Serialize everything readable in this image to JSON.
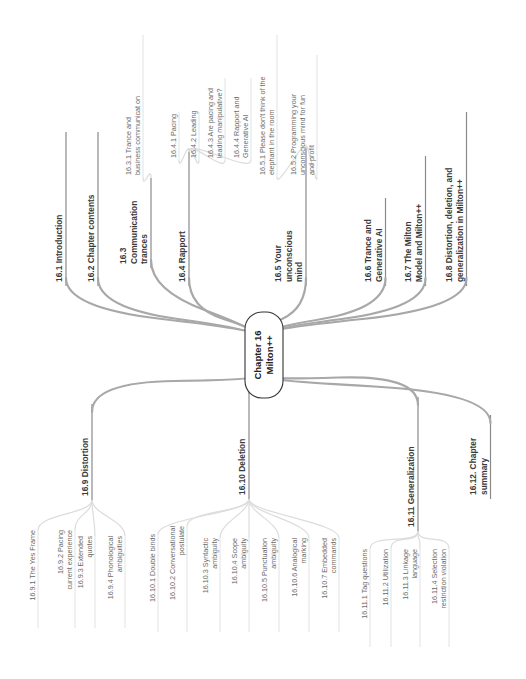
{
  "center": {
    "lines": [
      "Chapter 16",
      "Milton++"
    ]
  },
  "branches": [
    {
      "id": "16.1",
      "lines": [
        "16.1 Introduction"
      ],
      "children": []
    },
    {
      "id": "16.2",
      "lines": [
        "16.2 Chapter contents"
      ],
      "children": []
    },
    {
      "id": "16.3",
      "lines": [
        "16.3",
        "Communication",
        "trances"
      ],
      "children": [
        {
          "lines": [
            "16.3.1 Trance and",
            "business communicat on"
          ]
        }
      ]
    },
    {
      "id": "16.4",
      "lines": [
        "16.4 Rapport"
      ],
      "children": [
        {
          "lines": [
            "16.4.1 Pacing"
          ]
        },
        {
          "lines": [
            "16.4.2 Leading"
          ]
        },
        {
          "lines": [
            "16.4.3 Are pacing and",
            "leading manipulative?"
          ]
        },
        {
          "lines": [
            "16.4.4 Rapport and",
            "Generative AI"
          ]
        }
      ]
    },
    {
      "id": "16.5",
      "lines": [
        "16.5 Your",
        "unconscious",
        "mind"
      ],
      "children": [
        {
          "lines": [
            "16.5.1 Please don't think of the",
            "elephant in the room"
          ]
        },
        {
          "lines": [
            "16.5.2 Programming your",
            "unconscious mind for fun",
            "and profit"
          ]
        }
      ]
    },
    {
      "id": "16.6",
      "lines": [
        "16.6 Trance and",
        "Generative AI"
      ],
      "children": []
    },
    {
      "id": "16.7",
      "lines": [
        "16.7 The Milton",
        "Model and Milton++"
      ],
      "children": []
    },
    {
      "id": "16.8",
      "lines": [
        "16.8 Distortion, deletion, and",
        "generalization in Milton++"
      ],
      "children": []
    },
    {
      "id": "16.9",
      "lines": [
        "16.9 Distortion"
      ],
      "children": [
        {
          "lines": [
            "16.9.1 The Yes Frame"
          ]
        },
        {
          "lines": [
            "16.9.2 Pacing",
            "current experience"
          ]
        },
        {
          "lines": [
            "16.9.3 Extended",
            "quotes"
          ]
        },
        {
          "lines": [
            "16.9.4 Phonological",
            "ambiguities"
          ]
        }
      ]
    },
    {
      "id": "16.10",
      "lines": [
        "16.10 Deletion"
      ],
      "children": [
        {
          "lines": [
            "16.10.1 Double binds"
          ]
        },
        {
          "lines": [
            "16.10.2 Conversational",
            "postulate"
          ]
        },
        {
          "lines": [
            "16.10.3 Syntactic",
            "ambiguity"
          ]
        },
        {
          "lines": [
            "16.10.4 Scope",
            "ambiguity"
          ]
        },
        {
          "lines": [
            "16.10.5 Punctuation",
            "ambiguity"
          ]
        },
        {
          "lines": [
            "16.10.6 Analogical",
            "marking"
          ]
        },
        {
          "lines": [
            "16.10.7 Embedded",
            "commands"
          ]
        }
      ]
    },
    {
      "id": "16.11",
      "lines": [
        "16.11 Generalization"
      ],
      "children": [
        {
          "lines": [
            "16.11.1 Tag questions"
          ]
        },
        {
          "lines": [
            "16.11.2 Utilization"
          ]
        },
        {
          "lines": [
            "16.11.3 Linkage",
            "language"
          ]
        },
        {
          "lines": [
            "16.11.4 Selection",
            "restriction violation"
          ]
        }
      ]
    },
    {
      "id": "16.12",
      "lines": [
        "16.12. Chapter",
        "summary"
      ],
      "children": []
    }
  ],
  "colors": {
    "branch_line": "#a8a8a8",
    "sub_line": "#dcdcdc",
    "main_text": "#3a3a3a",
    "sub_text": "#6a6a6a",
    "center_border": "#333333"
  }
}
